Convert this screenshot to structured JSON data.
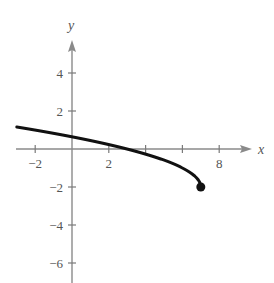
{
  "chart_data": {
    "type": "line",
    "title": "",
    "function": "y = sqrt(7 - x) - 2",
    "xlabel": "x",
    "ylabel": "y",
    "xlim": [
      -3,
      9.5
    ],
    "ylim": [
      -7,
      5.5
    ],
    "grid": false,
    "legend": null,
    "x_ticks": [
      -2,
      0,
      2,
      4,
      6,
      8
    ],
    "x_tick_labels": [
      {
        "value": -2,
        "label": "−2"
      },
      {
        "value": 2,
        "label": "2"
      },
      {
        "value": 8,
        "label": "8"
      }
    ],
    "y_ticks": [
      4,
      2,
      -2,
      -4,
      -6
    ],
    "y_tick_labels": [
      {
        "value": 4,
        "label": "4"
      },
      {
        "value": 2,
        "label": "2"
      },
      {
        "value": -2,
        "label": "−2"
      },
      {
        "value": -4,
        "label": "−4"
      },
      {
        "value": -6,
        "label": "−6"
      }
    ],
    "series": [
      {
        "name": "curve",
        "x": [
          -3,
          -2,
          -1,
          0,
          1,
          2,
          3,
          4,
          5,
          6,
          6.5,
          7
        ],
        "y": [
          1.16,
          1.0,
          0.83,
          0.65,
          0.45,
          0.24,
          0.0,
          -0.27,
          -0.59,
          -1.0,
          -1.29,
          -2.0
        ],
        "endpoint": {
          "x": 7,
          "y": -2,
          "marker": "filled-circle"
        },
        "color": "#111111"
      }
    ],
    "annotations": []
  }
}
